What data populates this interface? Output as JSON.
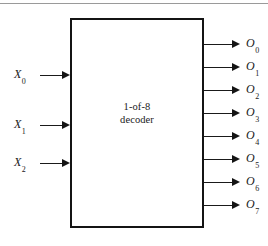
{
  "figure": {
    "type": "logic-block-diagram",
    "background_color": "#ffffff",
    "line_color": "#1a1a1a",
    "block": {
      "label_line1": "1-of-8",
      "label_line2": "decoder",
      "x": 70,
      "y": 18,
      "width": 134,
      "height": 210
    },
    "top_rule": true
  },
  "inputs": [
    {
      "label": "X",
      "subscript": "0",
      "y": 75,
      "wire_from_x": 40,
      "wire_to_x": 70,
      "label_x": 14
    },
    {
      "label": "X",
      "subscript": "1",
      "y": 125,
      "wire_from_x": 40,
      "wire_to_x": 70,
      "label_x": 14
    },
    {
      "label": "X",
      "subscript": "2",
      "y": 163,
      "wire_from_x": 40,
      "wire_to_x": 70,
      "label_x": 14
    }
  ],
  "outputs": [
    {
      "label": "O",
      "subscript": "0",
      "y": 44,
      "wire_from_x": 204,
      "wire_to_x": 240,
      "label_x": 246
    },
    {
      "label": "O",
      "subscript": "1",
      "y": 67,
      "wire_from_x": 204,
      "wire_to_x": 240,
      "label_x": 246
    },
    {
      "label": "O",
      "subscript": "2",
      "y": 90,
      "wire_from_x": 204,
      "wire_to_x": 240,
      "label_x": 246
    },
    {
      "label": "O",
      "subscript": "3",
      "y": 113,
      "wire_from_x": 204,
      "wire_to_x": 240,
      "label_x": 246
    },
    {
      "label": "O",
      "subscript": "4",
      "y": 136,
      "wire_from_x": 204,
      "wire_to_x": 240,
      "label_x": 246
    },
    {
      "label": "O",
      "subscript": "5",
      "y": 159,
      "wire_from_x": 204,
      "wire_to_x": 240,
      "label_x": 246
    },
    {
      "label": "O",
      "subscript": "6",
      "y": 182,
      "wire_from_x": 204,
      "wire_to_x": 240,
      "label_x": 246
    },
    {
      "label": "O",
      "subscript": "7",
      "y": 205,
      "wire_from_x": 204,
      "wire_to_x": 240,
      "label_x": 246
    }
  ]
}
